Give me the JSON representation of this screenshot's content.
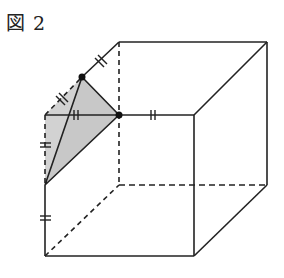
{
  "figure": {
    "label": "図 2",
    "type": "cube cross-section diagram",
    "line_color": "#222222",
    "shade_color": "#cfcfcf"
  },
  "cube": {
    "front_face": {
      "top_left": [
        45,
        115
      ],
      "top_right": [
        194,
        115
      ],
      "bottom_right": [
        194,
        256
      ],
      "bottom_left": [
        45,
        256
      ]
    },
    "back_face": {
      "top_left": [
        119,
        42
      ],
      "top_right": [
        267,
        42
      ],
      "bottom_right": [
        267,
        185
      ],
      "bottom_left": [
        119,
        185
      ]
    },
    "hidden_edges": [
      "back-left-vertical",
      "back-bottom",
      "bottom-left-depth",
      "front-left-upper-part"
    ]
  },
  "triangle": {
    "points": [
      [
        82,
        77
      ],
      [
        119,
        115
      ],
      [
        45,
        185
      ]
    ],
    "marked_points": [
      [
        82,
        77
      ],
      [
        119,
        115
      ]
    ],
    "equal_length_marks": "||"
  }
}
